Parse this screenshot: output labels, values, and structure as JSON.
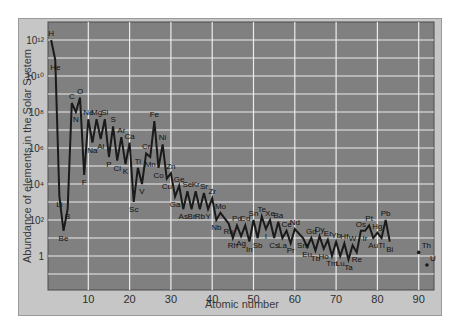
{
  "chart_data": {
    "type": "line",
    "title": "",
    "xlabel": "Atomic number",
    "ylabel": "Abundance of elements in the Solar System",
    "yscale": "log",
    "xlim": [
      0,
      93
    ],
    "ylim_log10": [
      -2,
      13
    ],
    "grid": true,
    "x_ticks": [
      10,
      20,
      30,
      40,
      50,
      60,
      70,
      80,
      90
    ],
    "y_ticks": [
      {
        "log": 12,
        "label": "10¹²"
      },
      {
        "log": 10,
        "label": "10¹⁰"
      },
      {
        "log": 8,
        "label": "10⁸"
      },
      {
        "log": 6,
        "label": "10⁶"
      },
      {
        "log": 4,
        "label": "10⁴"
      },
      {
        "log": 2,
        "label": "10²"
      },
      {
        "log": 0,
        "label": "1"
      }
    ],
    "series": [
      {
        "name": "Solar System abundance (log10)",
        "points": [
          {
            "z": 1,
            "el": "H",
            "log": 12.0
          },
          {
            "z": 2,
            "el": "He",
            "log": 10.9
          },
          {
            "z": 3,
            "el": "Li",
            "log": 3.3
          },
          {
            "z": 4,
            "el": "Be",
            "log": 1.4
          },
          {
            "z": 5,
            "el": "B",
            "log": 2.6
          },
          {
            "z": 6,
            "el": "C",
            "log": 8.5
          },
          {
            "z": 7,
            "el": "N",
            "log": 8.0
          },
          {
            "z": 8,
            "el": "O",
            "log": 8.8
          },
          {
            "z": 9,
            "el": "F",
            "log": 4.5
          },
          {
            "z": 10,
            "el": "Ne",
            "log": 7.6
          },
          {
            "z": 11,
            "el": "Na",
            "log": 6.3
          },
          {
            "z": 12,
            "el": "Mg",
            "log": 7.6
          },
          {
            "z": 13,
            "el": "Al",
            "log": 6.5
          },
          {
            "z": 14,
            "el": "Si",
            "log": 7.6
          },
          {
            "z": 15,
            "el": "P",
            "log": 5.5
          },
          {
            "z": 16,
            "el": "S",
            "log": 7.2
          },
          {
            "z": 17,
            "el": "Cl",
            "log": 5.3
          },
          {
            "z": 18,
            "el": "Ar",
            "log": 6.6
          },
          {
            "z": 19,
            "el": "K",
            "log": 5.1
          },
          {
            "z": 20,
            "el": "Ca",
            "log": 6.3
          },
          {
            "z": 21,
            "el": "Sc",
            "log": 3.0
          },
          {
            "z": 22,
            "el": "Ti",
            "log": 4.9
          },
          {
            "z": 23,
            "el": "V",
            "log": 4.0
          },
          {
            "z": 24,
            "el": "Cr",
            "log": 5.7
          },
          {
            "z": 25,
            "el": "Mn",
            "log": 5.5
          },
          {
            "z": 26,
            "el": "Fe",
            "log": 7.5
          },
          {
            "z": 27,
            "el": "Co",
            "log": 4.9
          },
          {
            "z": 28,
            "el": "Ni",
            "log": 6.2
          },
          {
            "z": 29,
            "el": "Cu",
            "log": 4.3
          },
          {
            "z": 30,
            "el": "Zn",
            "log": 4.6
          },
          {
            "z": 31,
            "el": "Ga",
            "log": 3.3
          },
          {
            "z": 32,
            "el": "Ge",
            "log": 3.9
          },
          {
            "z": 33,
            "el": "As",
            "log": 2.6
          },
          {
            "z": 34,
            "el": "Se",
            "log": 3.6
          },
          {
            "z": 35,
            "el": "Br",
            "log": 2.6
          },
          {
            "z": 36,
            "el": "Kr",
            "log": 3.6
          },
          {
            "z": 37,
            "el": "Rb",
            "log": 2.6
          },
          {
            "z": 38,
            "el": "Sr",
            "log": 3.5
          },
          {
            "z": 39,
            "el": "Y",
            "log": 2.6
          },
          {
            "z": 40,
            "el": "Zr",
            "log": 3.2
          },
          {
            "z": 41,
            "el": "Nb",
            "log": 2.0
          },
          {
            "z": 42,
            "el": "Mo",
            "log": 2.4
          },
          {
            "z": 44,
            "el": "Ru",
            "log": 1.8
          },
          {
            "z": 45,
            "el": "Rh",
            "log": 1.0
          },
          {
            "z": 46,
            "el": "Pd",
            "log": 1.7
          },
          {
            "z": 47,
            "el": "Ag",
            "log": 1.1
          },
          {
            "z": 48,
            "el": "Cd",
            "log": 1.7
          },
          {
            "z": 49,
            "el": "In",
            "log": 0.8
          },
          {
            "z": 50,
            "el": "Sn",
            "log": 2.0
          },
          {
            "z": 51,
            "el": "Sb",
            "log": 1.0
          },
          {
            "z": 52,
            "el": "Te",
            "log": 2.2
          },
          {
            "z": 53,
            "el": "I",
            "log": 1.5
          },
          {
            "z": 54,
            "el": "Xe",
            "log": 2.0
          },
          {
            "z": 55,
            "el": "Cs",
            "log": 1.0
          },
          {
            "z": 56,
            "el": "Ba",
            "log": 1.9
          },
          {
            "z": 57,
            "el": "La",
            "log": 1.0
          },
          {
            "z": 58,
            "el": "Ce",
            "log": 1.4
          },
          {
            "z": 59,
            "el": "Pr",
            "log": 0.7
          },
          {
            "z": 60,
            "el": "Nd",
            "log": 1.5
          },
          {
            "z": 62,
            "el": "Sm",
            "log": 1.0
          },
          {
            "z": 63,
            "el": "Eu",
            "log": 0.5
          },
          {
            "z": 64,
            "el": "Gd",
            "log": 1.0
          },
          {
            "z": 65,
            "el": "Tb",
            "log": 0.3
          },
          {
            "z": 66,
            "el": "Dy",
            "log": 1.1
          },
          {
            "z": 67,
            "el": "Ho",
            "log": 0.4
          },
          {
            "z": 68,
            "el": "Er",
            "log": 0.9
          },
          {
            "z": 69,
            "el": "Tm",
            "log": 0.0
          },
          {
            "z": 70,
            "el": "Yb",
            "log": 0.8
          },
          {
            "z": 71,
            "el": "Lu",
            "log": 0.0
          },
          {
            "z": 72,
            "el": "Hf",
            "log": 0.7
          },
          {
            "z": 73,
            "el": "Ta",
            "log": -0.2
          },
          {
            "z": 74,
            "el": "W",
            "log": 0.6
          },
          {
            "z": 75,
            "el": "Re",
            "log": 0.2
          },
          {
            "z": 76,
            "el": "Os",
            "log": 1.4
          },
          {
            "z": 77,
            "el": "Ir",
            "log": 1.4
          },
          {
            "z": 78,
            "el": "Pt",
            "log": 1.7
          },
          {
            "z": 79,
            "el": "Au",
            "log": 1.0
          },
          {
            "z": 80,
            "el": "Hg",
            "log": 1.3
          },
          {
            "z": 81,
            "el": "Tl",
            "log": 1.0
          },
          {
            "z": 82,
            "el": "Pb",
            "log": 2.0
          },
          {
            "z": 83,
            "el": "Bi",
            "log": 0.8
          }
        ]
      },
      {
        "name": "Actinides (isolated points)",
        "points": [
          {
            "z": 90,
            "el": "Th",
            "log": 0.2
          },
          {
            "z": 92,
            "el": "U",
            "log": -0.5
          }
        ]
      }
    ]
  },
  "colors": {
    "frame_bg": "#c6c6c6",
    "plot_bg": "#808080",
    "grid": "#ececec",
    "line": "#1a1a1a",
    "text": "#2e2e2e"
  }
}
